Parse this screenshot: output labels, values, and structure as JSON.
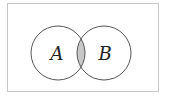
{
  "diagram": {
    "type": "venn",
    "title": "",
    "frame": {
      "x": 7,
      "y": 3,
      "width": 151,
      "height": 88,
      "stroke": "#c8c8c8"
    },
    "sets": [
      {
        "label": "A",
        "cx": 58,
        "cy": 53,
        "r": 27,
        "label_x": 57,
        "label_y": 60
      },
      {
        "label": "B",
        "cx": 104,
        "cy": 53,
        "r": 27,
        "label_x": 105,
        "label_y": 60
      }
    ],
    "intersection": {
      "label": "A ∩ B",
      "shaded": true,
      "fill": "#c8c8c8"
    },
    "colors": {
      "circle_stroke": "#555555",
      "background": "#ffffff",
      "text": "#222222"
    }
  }
}
